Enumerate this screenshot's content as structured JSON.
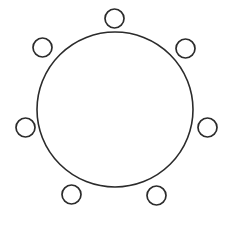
{
  "canvas": {
    "width": 229,
    "height": 226,
    "background_color": "#ffffff",
    "title": "Circle with six small circles arranged around its circumference"
  },
  "style": {
    "stroke_color": "#2b2b2b",
    "fill_color": "none",
    "main_stroke_width": 1.6,
    "node_stroke_width": 1.7
  },
  "diagram": {
    "type": "circle-with-nodes",
    "main_circle": {
      "label": "main-circle",
      "cx": 115,
      "cy": 109.5,
      "rx": 78,
      "ry": 77.5
    },
    "nodes": [
      {
        "label": "node-top",
        "cx": 114.5,
        "cy": 18.5,
        "r": 9.5
      },
      {
        "label": "node-upper-left",
        "cx": 42.5,
        "cy": 47.5,
        "r": 9.5
      },
      {
        "label": "node-upper-right",
        "cx": 185.5,
        "cy": 48.5,
        "r": 9.5
      },
      {
        "label": "node-left",
        "cx": 25.5,
        "cy": 127.5,
        "r": 9.5
      },
      {
        "label": "node-right",
        "cx": 207.5,
        "cy": 127.5,
        "r": 9.5
      },
      {
        "label": "node-bottom-left",
        "cx": 71.5,
        "cy": 194.5,
        "r": 9.5
      },
      {
        "label": "node-bottom-right",
        "cx": 156.5,
        "cy": 195.5,
        "r": 9.5
      }
    ],
    "node_count": 7
  }
}
